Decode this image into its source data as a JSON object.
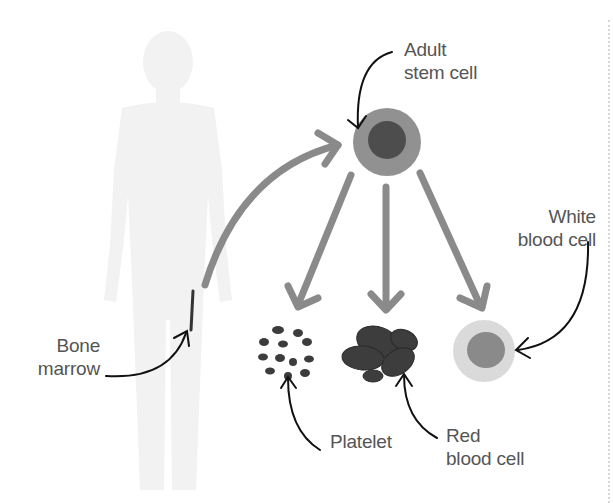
{
  "diagram": {
    "labels": {
      "stem_cell_line1": "Adult",
      "stem_cell_line2": "stem cell",
      "white_line1": "White",
      "white_line2": "blood cell",
      "bone_line1": "Bone",
      "bone_line2": "marrow",
      "platelet": "Platelet",
      "red_line1": "Red",
      "red_line2": "blood cell"
    },
    "nodes": [
      {
        "id": "bone-marrow",
        "label": "Bone marrow"
      },
      {
        "id": "adult-stem-cell",
        "label": "Adult stem cell"
      },
      {
        "id": "platelet",
        "label": "Platelet"
      },
      {
        "id": "red-blood-cell",
        "label": "Red blood cell"
      },
      {
        "id": "white-blood-cell",
        "label": "White blood cell"
      }
    ],
    "edges": [
      {
        "from": "bone-marrow",
        "to": "adult-stem-cell"
      },
      {
        "from": "adult-stem-cell",
        "to": "platelet"
      },
      {
        "from": "adult-stem-cell",
        "to": "red-blood-cell"
      },
      {
        "from": "adult-stem-cell",
        "to": "white-blood-cell"
      }
    ],
    "colors": {
      "body_silhouette": "#f1f1f1",
      "flow_arrow": "#8a8a8a",
      "stem_outer": "#8f8f8f",
      "stem_inner": "#4a4a4a",
      "cell_dark": "#3a3a3a",
      "white_outer": "#d9d9d9",
      "white_inner": "#8a8a8a",
      "pointer": "#111111",
      "text": "#555555"
    }
  }
}
